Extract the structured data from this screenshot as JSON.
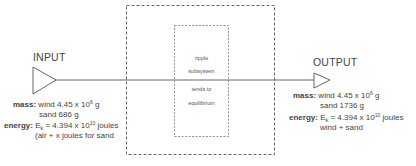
{
  "input": {
    "title": "INPUT",
    "mass_label": "mass:",
    "mass_wind": "wind  4.45  x  10",
    "mass_wind_exp": "6",
    "mass_wind_unit": " g",
    "mass_sand": "sand 686 g",
    "energy_label": "energy:",
    "energy_sym": "E",
    "energy_sub": "k",
    "energy_value": " = 4.394 x 10",
    "energy_exp": "10",
    "energy_unit": " joules",
    "energy_note": "(air + x joules for sand"
  },
  "output": {
    "title": "OUTPUT",
    "mass_label": "mass:",
    "mass_wind": "wind  4.45  x  10",
    "mass_wind_exp": "6",
    "mass_wind_unit": " g",
    "mass_sand": "sand  1736 g",
    "energy_label": "energy:",
    "energy_sym": "E",
    "energy_sub": "k",
    "energy_value": " = 4.394 x 10",
    "energy_exp": "10",
    "energy_unit": " joules",
    "energy_note": "wind + sand"
  },
  "subsystem": {
    "line1": "ripple",
    "line2": "subsystem",
    "line3": "tends to",
    "line4": "equilibrium"
  },
  "colors": {
    "stroke": "#555555",
    "text": "#444444"
  }
}
